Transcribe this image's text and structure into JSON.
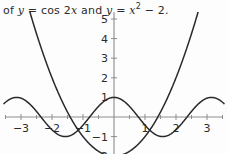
{
  "caption": {
    "prefix": "of ",
    "var1": "y",
    "eq1": " = cos 2",
    "var1x": "x",
    "conj": " and ",
    "var2": "y",
    "eq2": " = ",
    "var2x": "x",
    "exponent": "2",
    "tail": " − 2.",
    "full_text": "of y = cos 2x and y = x² − 2."
  },
  "colors": {
    "background": "#fdfdfd",
    "axis": "#8d8d8d",
    "curve": "#2a2a2a",
    "text": "#2b2b2b"
  },
  "chart_data": {
    "type": "line",
    "xlabel": "",
    "ylabel": "",
    "xlim": [
      -3.55,
      3.55
    ],
    "ylim": [
      -2.35,
      5.6
    ],
    "grid": false,
    "legend": "none",
    "axis_style": "centered-cross",
    "xticks": [
      -3,
      -2,
      -1,
      1,
      2,
      3
    ],
    "xtick_labels": [
      "−3",
      "−2",
      "−1",
      "1",
      "2",
      "3"
    ],
    "yticks": [
      -2,
      -1,
      1,
      2,
      3,
      4,
      5
    ],
    "ytick_labels": [
      "−2",
      "−1",
      "1",
      "2",
      "3",
      "4",
      "5"
    ],
    "ytick_labels_drawn": [
      "−2",
      "−1",
      "1",
      "2",
      "3",
      "4",
      "5"
    ],
    "minor_xticks": [
      -3.5,
      -2.5,
      -1.5,
      -0.5,
      0.5,
      1.5,
      2.5,
      3.5
    ],
    "series": [
      {
        "name": "y = cos 2x",
        "expression": "cos(2*x)",
        "amplitude": 1,
        "period": 3.14159,
        "maxima_at": [
          -3.14159,
          0,
          3.14159
        ],
        "minima_at": [
          -1.5708,
          1.5708
        ],
        "samples_x": [
          -3.5,
          -3.25,
          -3.0,
          -2.75,
          -2.5,
          -2.25,
          -2.0,
          -1.75,
          -1.5,
          -1.25,
          -1.0,
          -0.75,
          -0.5,
          -0.25,
          0,
          0.25,
          0.5,
          0.75,
          1.0,
          1.25,
          1.5,
          1.75,
          2.0,
          2.25,
          2.5,
          2.75,
          3.0,
          3.25,
          3.5
        ],
        "samples_y": [
          0.7539,
          0.9394,
          0.9602,
          0.7935,
          0.2837,
          -0.2272,
          -0.6536,
          -0.9364,
          -0.99,
          -0.8011,
          -0.4161,
          0.0707,
          0.5403,
          0.8776,
          1.0,
          0.8776,
          0.5403,
          0.0707,
          -0.4161,
          -0.8011,
          -0.99,
          -0.9364,
          -0.6536,
          -0.2272,
          0.2837,
          0.7935,
          0.9602,
          0.9394,
          0.7539
        ]
      },
      {
        "name": "y = x² − 2",
        "expression": "x^2 - 2",
        "vertex": [
          0,
          -2
        ],
        "roots": [
          -1.41421,
          1.41421
        ],
        "samples_x": [
          -2.75,
          -2.5,
          -2.25,
          -2.0,
          -1.75,
          -1.5,
          -1.25,
          -1.0,
          -0.75,
          -0.5,
          -0.25,
          0,
          0.25,
          0.5,
          0.75,
          1.0,
          1.25,
          1.5,
          1.75,
          2.0,
          2.25,
          2.5,
          2.75
        ],
        "samples_y": [
          5.5625,
          4.25,
          3.0625,
          2.0,
          1.0625,
          0.25,
          -0.4375,
          -1.0,
          -1.4375,
          -1.75,
          -1.9375,
          -2.0,
          -1.9375,
          -1.75,
          -1.4375,
          -1.0,
          -0.4375,
          0.25,
          1.0625,
          2.0,
          3.0625,
          4.25,
          5.5625
        ]
      }
    ],
    "intersections": [
      [
        -1.2,
        -0.56
      ],
      [
        1.2,
        -0.56
      ]
    ]
  }
}
